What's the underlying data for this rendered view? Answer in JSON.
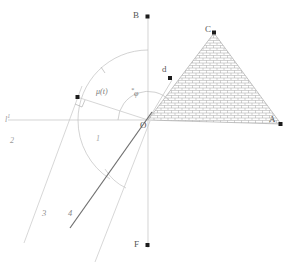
{
  "figure": {
    "background": "#ffffff",
    "line_color": "#b9b9b9",
    "bold_line_color": "#6a6a6a",
    "hatch_color": "#9a9a9a",
    "marker_color": "#1a1a1a",
    "text_color": "#6e6e6e"
  },
  "points": {
    "origin": "O",
    "top": "B",
    "bottom": "F",
    "apex": "C",
    "right": "A",
    "interior": "d",
    "tangent": "e"
  },
  "angles": {
    "mu": "μ(t)",
    "phi": "φ",
    "phi_sup": "*"
  },
  "axes": {
    "left": "l",
    "left_sub": "1",
    "lower_left": "2"
  },
  "rays": {
    "ray3": "3",
    "ray4": "4"
  },
  "lengths": {
    "unit": "1"
  }
}
